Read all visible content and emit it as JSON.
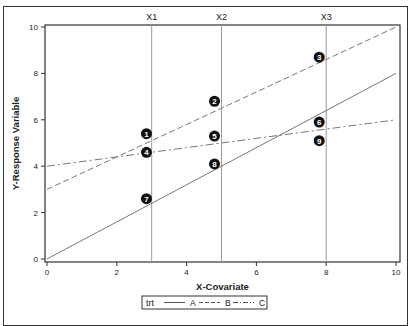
{
  "chart_data": {
    "type": "line",
    "title": "",
    "xlabel": "X-Covariate",
    "ylabel": "Y-Response Variable",
    "xlim": [
      0,
      10
    ],
    "ylim": [
      0,
      10
    ],
    "x_ticks": [
      "0",
      "2",
      "4",
      "6",
      "8",
      "10"
    ],
    "y_ticks": [
      "0",
      "2",
      "4",
      "6",
      "8",
      "10"
    ],
    "grid": false,
    "reference_lines": [
      {
        "label": "X1",
        "x": 3
      },
      {
        "label": "X2",
        "x": 5
      },
      {
        "label": "X3",
        "x": 8
      }
    ],
    "series": [
      {
        "name": "A",
        "style": "solid",
        "x": [
          0,
          10
        ],
        "y": [
          0,
          8
        ]
      },
      {
        "name": "B",
        "style": "dashed",
        "x": [
          0,
          10
        ],
        "y": [
          3,
          10
        ]
      },
      {
        "name": "C",
        "style": "dashdot",
        "x": [
          0,
          10
        ],
        "y": [
          4,
          6
        ]
      }
    ],
    "markers": [
      {
        "label": "1",
        "x": 2.85,
        "y": 5.4
      },
      {
        "label": "2",
        "x": 4.8,
        "y": 6.8
      },
      {
        "label": "3",
        "x": 7.8,
        "y": 8.7
      },
      {
        "label": "4",
        "x": 2.85,
        "y": 4.6
      },
      {
        "label": "5",
        "x": 4.8,
        "y": 5.3
      },
      {
        "label": "6",
        "x": 7.8,
        "y": 5.9
      },
      {
        "label": "7",
        "x": 2.85,
        "y": 2.6
      },
      {
        "label": "8",
        "x": 4.8,
        "y": 4.1
      },
      {
        "label": "9",
        "x": 7.8,
        "y": 5.1
      }
    ],
    "legend": {
      "title": "trt",
      "entries": [
        "A",
        "B",
        "C"
      ],
      "position": "bottom"
    }
  }
}
